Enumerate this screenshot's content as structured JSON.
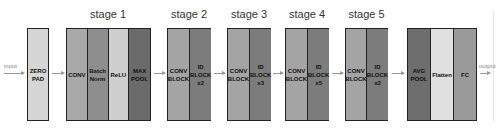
{
  "io": {
    "input_label": "input",
    "output_label": "output"
  },
  "zero_pad": {
    "label": "ZERO\nPAD",
    "color": "#d6d6d6"
  },
  "stages": [
    {
      "label": "stage 1",
      "layers": [
        {
          "label": "CONV",
          "color": "#a9a9a9"
        },
        {
          "label": "Batch\nNorm",
          "color": "#8e8e8e"
        },
        {
          "label": "ReLU",
          "color": "#cfcfcf"
        },
        {
          "label": "MAX\nPOOL",
          "color": "#6b6b6b"
        }
      ]
    },
    {
      "label": "stage 2",
      "layers": [
        {
          "label": "CONV\nBLOCK",
          "color": "#a4a4a4"
        },
        {
          "label": "ID\nBLOCK\nx2",
          "color": "#7c7c7c"
        }
      ]
    },
    {
      "label": "stage 3",
      "layers": [
        {
          "label": "CONV\nBLOCK",
          "color": "#a4a4a4"
        },
        {
          "label": "ID\nBLOCK\nx3",
          "color": "#7c7c7c"
        }
      ]
    },
    {
      "label": "stage 4",
      "layers": [
        {
          "label": "CONV\nBLOCK",
          "color": "#a4a4a4"
        },
        {
          "label": "ID\nBLOCK\nx5",
          "color": "#7c7c7c"
        }
      ]
    },
    {
      "label": "stage 5",
      "layers": [
        {
          "label": "CONV\nBLOCK",
          "color": "#a4a4a4"
        },
        {
          "label": "ID\nBLOCK\nx2",
          "color": "#7c7c7c"
        }
      ]
    }
  ],
  "head": {
    "layers": [
      {
        "label": "AVG\nPOOL",
        "color": "#6e6e6e"
      },
      {
        "label": "Flatten",
        "color": "#e0e0e0"
      },
      {
        "label": "FC",
        "color": "#9a9a9a"
      }
    ]
  }
}
